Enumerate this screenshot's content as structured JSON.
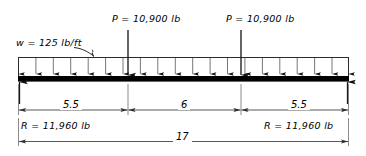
{
  "diagram": {
    "type": "beam-load-diagram",
    "beam": {
      "span_label": "17",
      "span_value": 17,
      "units": "ft"
    },
    "distributed_load": {
      "label": "w = 125 lb/ft",
      "symbol": "w",
      "value": "125",
      "units": "lb/ft",
      "arrow_count": 20
    },
    "point_loads": [
      {
        "label": "P = 10,900 lb",
        "symbol": "P",
        "value": "10,900",
        "units": "lb",
        "position": 5.5
      },
      {
        "label": "P = 10,900 lb",
        "symbol": "P",
        "value": "10,900",
        "units": "lb",
        "position": 11.5
      }
    ],
    "reactions": [
      {
        "label": "R = 11,960 lb",
        "symbol": "R",
        "value": "11,960",
        "units": "lb",
        "side": "left"
      },
      {
        "label": "R = 11,960 lb",
        "symbol": "R",
        "value": "11,960",
        "units": "lb",
        "side": "right"
      }
    ],
    "dimensions": [
      {
        "label": "5.5",
        "value": 5.5,
        "segment": "left"
      },
      {
        "label": "6",
        "value": 6,
        "segment": "center"
      },
      {
        "label": "5.5",
        "value": 5.5,
        "segment": "right"
      },
      {
        "label": "17",
        "value": 17,
        "segment": "overall"
      }
    ],
    "colors": {
      "beam": "#000000",
      "line": "#2b2b2b",
      "dimension": "#3a3a3a",
      "background": "#ffffff"
    }
  }
}
